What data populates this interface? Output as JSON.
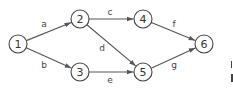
{
  "diagram": {
    "type": "directed-graph",
    "nodes": [
      {
        "id": "1",
        "label": "1",
        "x": 18,
        "y": 44
      },
      {
        "id": "2",
        "label": "2",
        "x": 80,
        "y": 19
      },
      {
        "id": "3",
        "label": "3",
        "x": 80,
        "y": 72
      },
      {
        "id": "4",
        "label": "4",
        "x": 143,
        "y": 19
      },
      {
        "id": "5",
        "label": "5",
        "x": 143,
        "y": 72
      },
      {
        "id": "6",
        "label": "6",
        "x": 204,
        "y": 44
      }
    ],
    "edges": [
      {
        "from": "1",
        "to": "2",
        "label": "a",
        "lx": 44,
        "ly": 24
      },
      {
        "from": "1",
        "to": "3",
        "label": "b",
        "lx": 44,
        "ly": 65
      },
      {
        "from": "2",
        "to": "4",
        "label": "c",
        "lx": 110,
        "ly": 12
      },
      {
        "from": "2",
        "to": "5",
        "label": "d",
        "lx": 102,
        "ly": 48
      },
      {
        "from": "3",
        "to": "5",
        "label": "e",
        "lx": 110,
        "ly": 80
      },
      {
        "from": "4",
        "to": "6",
        "label": "f",
        "lx": 174,
        "ly": 24
      },
      {
        "from": "5",
        "to": "6",
        "label": "g",
        "lx": 174,
        "ly": 65
      }
    ],
    "node_radius": 9
  }
}
